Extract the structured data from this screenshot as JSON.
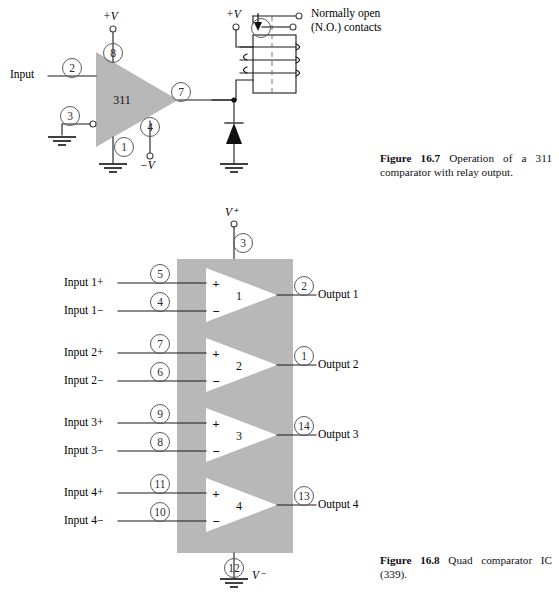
{
  "page": {
    "width": 559,
    "height": 602,
    "background": "#ffffff",
    "ink": "#000000",
    "block_fill": "#b8b8b8",
    "pin_circle_stroke": "#555555"
  },
  "figure_16_7": {
    "caption_label": "Figure 16.7",
    "caption_text": "Operation of a 311 comparator with relay output.",
    "device_label": "311",
    "input_label": "Input",
    "supply_positive": "+V",
    "supply_negative": "−V",
    "relay_supply": "+V",
    "relay_note_line1": "Normally open",
    "relay_note_line2": "(N.O.) contacts",
    "pins": [
      {
        "name": "input-pin",
        "number": "2"
      },
      {
        "name": "vplus-pin",
        "number": "8"
      },
      {
        "name": "balance-pin",
        "number": "3"
      },
      {
        "name": "output-pin",
        "number": "7"
      },
      {
        "name": "strobe-pin",
        "number": "4"
      },
      {
        "name": "ground-pin",
        "number": "1"
      }
    ],
    "components": {
      "diode": "flyback-diode",
      "relay": "relay-coil-with-no-contacts",
      "grounds": 3
    }
  },
  "figure_16_8": {
    "caption_label": "Figure 16.8",
    "caption_text": "Quad comparator IC (339).",
    "supply_positive": "V⁺",
    "supply_negative": "V⁻",
    "supply_positive_pin": "3",
    "supply_negative_pin": "12",
    "comparators": [
      {
        "index": "1",
        "plus_label": "Input 1+",
        "plus_pin": "5",
        "minus_label": "Input 1−",
        "minus_pin": "4",
        "output_label": "Output 1",
        "output_pin": "2",
        "plus_sign": "+",
        "minus_sign": "−"
      },
      {
        "index": "2",
        "plus_label": "Input 2+",
        "plus_pin": "7",
        "minus_label": "Input 2−",
        "minus_pin": "6",
        "output_label": "Output 2",
        "output_pin": "1",
        "plus_sign": "+",
        "minus_sign": "−"
      },
      {
        "index": "3",
        "plus_label": "Input 3+",
        "plus_pin": "9",
        "minus_label": "Input 3−",
        "minus_pin": "8",
        "output_label": "Output 3",
        "output_pin": "14",
        "plus_sign": "+",
        "minus_sign": "−"
      },
      {
        "index": "4",
        "plus_label": "Input 4+",
        "plus_pin": "11",
        "minus_label": "Input 4−",
        "minus_pin": "10",
        "output_label": "Output 4",
        "output_pin": "13",
        "plus_sign": "+",
        "minus_sign": "−"
      }
    ]
  }
}
